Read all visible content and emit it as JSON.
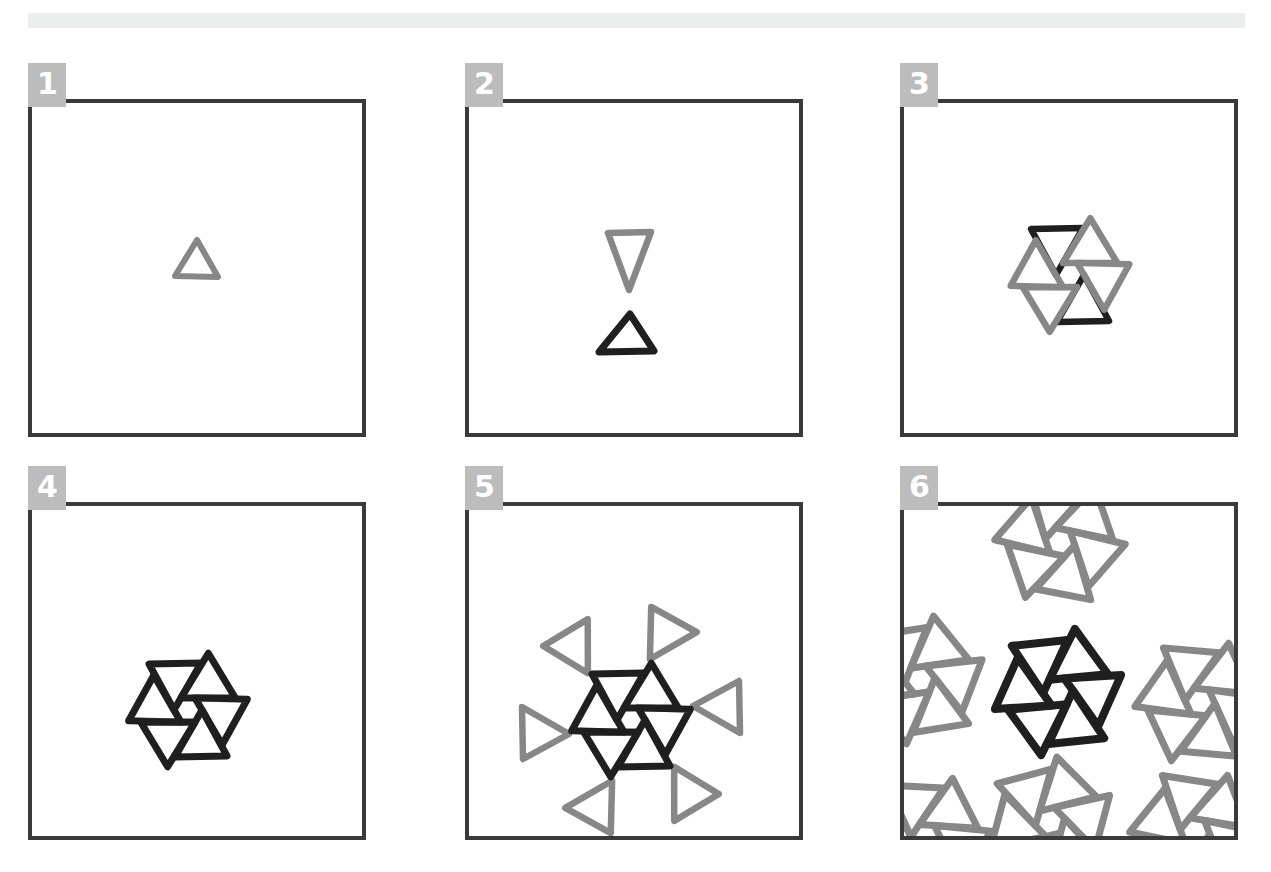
{
  "figure": {
    "panel_count": 6,
    "background_color": "#ffffff",
    "top_bar": {
      "name": "top-rule",
      "color": "#eceded"
    },
    "colors": {
      "frame": "#3a3a3c",
      "badge_background": "#bcbcbc",
      "badge_text": "#ffffff",
      "ink_black": "#1f1f1f",
      "ink_gray": "#878787"
    },
    "panels": [
      {
        "number": "1",
        "label": "1",
        "description": "single gray upward triangle at centre",
        "motif": "single-triangle",
        "black_count": 0,
        "gray_count": 1
      },
      {
        "number": "2",
        "label": "2",
        "description": "gray downward triangle above black upward triangle",
        "motif": "triangle-pair",
        "black_count": 1,
        "gray_count": 1
      },
      {
        "number": "3",
        "label": "3",
        "description": "six-petal rosette, two black petals (top and bottom) and four gray petals",
        "motif": "rosette-partial",
        "black_count": 2,
        "gray_count": 4
      },
      {
        "number": "4",
        "label": "4",
        "description": "complete six-petal rosette, all petals black",
        "motif": "rosette-complete",
        "black_count": 6,
        "gray_count": 0
      },
      {
        "number": "5",
        "label": "5",
        "description": "black six-petal rosette with outer ring of six gray triangles",
        "motif": "rosette-with-halo",
        "black_count": 6,
        "gray_count": 6
      },
      {
        "number": "6",
        "label": "6",
        "description": "tiled field: central black rosette surrounded by repeating gray rosettes clipped by the frame",
        "motif": "rosette-tiling",
        "black_count": 6,
        "gray_count": 30
      }
    ]
  }
}
